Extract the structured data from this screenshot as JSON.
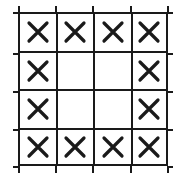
{
  "diagram": {
    "rows": 4,
    "cols": 4,
    "mark_symbol": "X",
    "line_color": "#1a1a1a",
    "cells": [
      [
        "X",
        "X",
        "X",
        "X"
      ],
      [
        "X",
        "",
        "",
        "X"
      ],
      [
        "X",
        "",
        "",
        "X"
      ],
      [
        "X",
        "X",
        "X",
        "X"
      ]
    ]
  }
}
